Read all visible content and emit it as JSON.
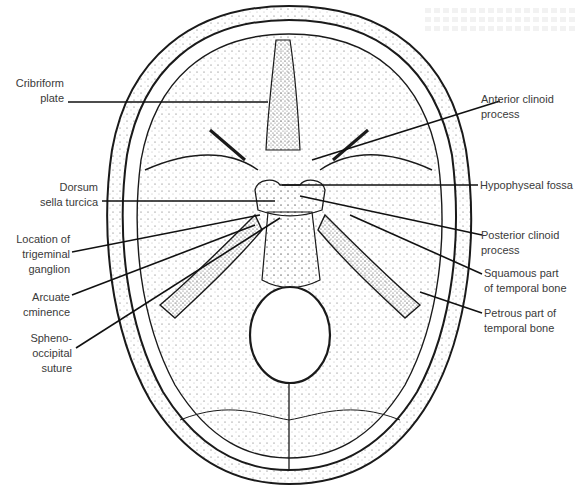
{
  "figure": {
    "colors": {
      "ink": "#1a1a1a",
      "label": "#3a3a3a",
      "paper": "#ffffff"
    },
    "labels_left": [
      {
        "id": "cribriform",
        "text": "Cribriform\nplate"
      },
      {
        "id": "dorsum",
        "text": "Dorsum\nsella turcica"
      },
      {
        "id": "trigeminal",
        "text": "Location of\ntrigeminal\nganglion"
      },
      {
        "id": "arcuate",
        "text": "Arcuate\ncminence"
      },
      {
        "id": "spheno",
        "text": "Spheno-\noccipital\nsuture"
      }
    ],
    "labels_right": [
      {
        "id": "anterior_clinoid",
        "text": "Anterior clinoid\nprocess"
      },
      {
        "id": "hypophyseal",
        "text": "Hypophyseal fossa"
      },
      {
        "id": "posterior_clinoid",
        "text": "Posterior clinoid\nprocess"
      },
      {
        "id": "squamous",
        "text": "Squamous part\nof temporal bone"
      },
      {
        "id": "petrous",
        "text": "Petrous part of\ntemporal bone"
      }
    ]
  }
}
